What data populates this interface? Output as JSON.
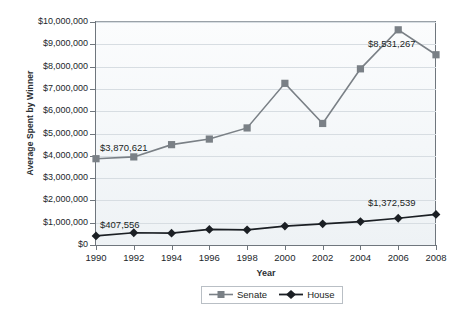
{
  "chart_data": {
    "type": "line",
    "title": "",
    "xlabel": "Year",
    "ylabel": "Average Spent by Winner",
    "categories": [
      "1990",
      "1992",
      "1994",
      "1996",
      "1998",
      "2000",
      "2002",
      "2004",
      "2006",
      "2008"
    ],
    "ylim": [
      0,
      10000000
    ],
    "ytick_values": [
      0,
      1000000,
      2000000,
      3000000,
      4000000,
      5000000,
      6000000,
      7000000,
      8000000,
      9000000,
      10000000
    ],
    "ytick_labels": [
      "$0",
      "$1,000,000",
      "$2,000,000",
      "$3,000,000",
      "$4,000,000",
      "$5,000,000",
      "$6,000,000",
      "$7,000,000",
      "$8,000,000",
      "$9,000,000",
      "$10,000,000"
    ],
    "grid": true,
    "legend_position": "bottom-center",
    "series": [
      {
        "name": "Senate",
        "color": "#7a8086",
        "marker": "square",
        "values": [
          3870621,
          3950000,
          4500000,
          4750000,
          5250000,
          7250000,
          5450000,
          7900000,
          9650000,
          8531267
        ]
      },
      {
        "name": "House",
        "color": "#1b1f24",
        "marker": "diamond",
        "values": [
          407556,
          550000,
          530000,
          700000,
          680000,
          850000,
          950000,
          1050000,
          1200000,
          1372539
        ]
      }
    ],
    "annotations": [
      {
        "text": "$3,870,621",
        "series": "Senate",
        "category": "1990",
        "value": 3870621
      },
      {
        "text": "$407,556",
        "series": "House",
        "category": "1990",
        "value": 407556
      },
      {
        "text": "$8,531,267",
        "series": "Senate",
        "category": "2008",
        "value": 8531267
      },
      {
        "text": "$1,372,539",
        "series": "House",
        "category": "2008",
        "value": 1372539
      }
    ]
  },
  "legend": {
    "items": [
      {
        "label": "Senate"
      },
      {
        "label": "House"
      }
    ]
  },
  "top_strip": {
    "text": ""
  }
}
